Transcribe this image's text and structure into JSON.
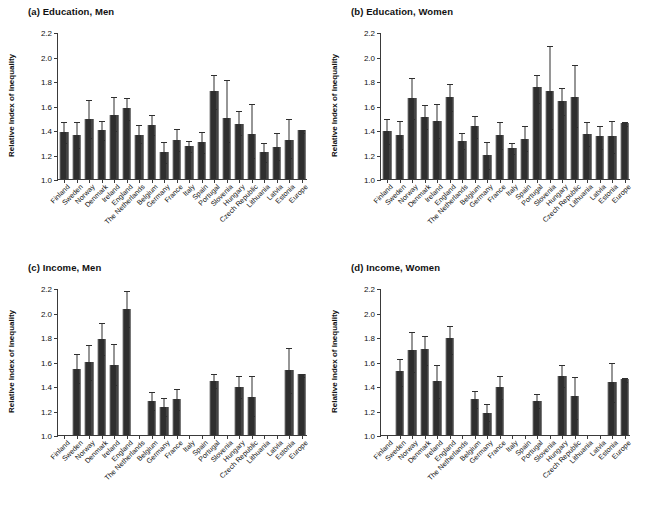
{
  "figure": {
    "ylabel": "Relative Index of Inequality",
    "ytick_labels": [
      "1.0",
      "1.2",
      "1.4",
      "1.6",
      "1.8",
      "2.0",
      "2.2"
    ],
    "bar_color": "#2f2f2f",
    "axis_color": "#3a3a3a"
  },
  "chart_data": [
    {
      "type": "bar",
      "panel": "a",
      "title": "(a) Education, Men",
      "xlabel": "",
      "ylabel": "Relative Index of Inequality",
      "ylim": [
        1.0,
        2.2
      ],
      "yticks": [
        1.0,
        1.2,
        1.4,
        1.6,
        1.8,
        2.0,
        2.2
      ],
      "grid": false,
      "legend": "none",
      "error_bars": "95% CI",
      "categories": [
        "Finland",
        "Sweden",
        "Norway",
        "Denmark",
        "Ireland",
        "England",
        "The Netherlands",
        "Belgium",
        "Germany",
        "France",
        "Italy",
        "Spain",
        "Portugal",
        "Slovenia",
        "Hungary",
        "Czech Republic",
        "Lithuania",
        "Latvia",
        "Estonia",
        "Europe"
      ],
      "values": [
        1.38,
        1.36,
        1.49,
        1.4,
        1.52,
        1.58,
        1.36,
        1.44,
        1.22,
        1.32,
        1.27,
        1.3,
        1.72,
        1.5,
        1.45,
        1.37,
        1.22,
        1.26,
        1.32,
        1.4
      ],
      "ci_low": [
        1.3,
        1.26,
        1.34,
        1.33,
        1.4,
        1.49,
        1.3,
        1.37,
        1.14,
        1.24,
        1.23,
        1.22,
        1.58,
        1.31,
        1.37,
        1.18,
        1.15,
        1.16,
        1.18,
        1.38
      ],
      "ci_high": [
        1.47,
        1.47,
        1.65,
        1.48,
        1.68,
        1.67,
        1.45,
        1.53,
        1.31,
        1.42,
        1.32,
        1.39,
        1.86,
        1.82,
        1.56,
        1.62,
        1.3,
        1.38,
        1.5,
        1.41
      ]
    },
    {
      "type": "bar",
      "panel": "b",
      "title": "(b) Education, Women",
      "xlabel": "",
      "ylabel": "Relative Index of Inequality",
      "ylim": [
        1.0,
        2.2
      ],
      "yticks": [
        1.0,
        1.2,
        1.4,
        1.6,
        1.8,
        2.0,
        2.2
      ],
      "grid": false,
      "legend": "none",
      "error_bars": "95% CI",
      "categories": [
        "Finland",
        "Sweden",
        "Norway",
        "Denmark",
        "Ireland",
        "England",
        "The Netherlands",
        "Belgium",
        "Germany",
        "France",
        "Italy",
        "Spain",
        "Portugal",
        "Slovenia",
        "Hungary",
        "Czech Republic",
        "Lithuania",
        "Latvia",
        "Estonia",
        "Europe"
      ],
      "values": [
        1.39,
        1.36,
        1.66,
        1.51,
        1.47,
        1.67,
        1.31,
        1.43,
        1.2,
        1.36,
        1.25,
        1.33,
        1.75,
        1.72,
        1.64,
        1.67,
        1.37,
        1.35,
        1.35,
        1.46
      ],
      "ci_low": [
        1.29,
        1.25,
        1.5,
        1.42,
        1.34,
        1.56,
        1.25,
        1.34,
        1.09,
        1.25,
        1.21,
        1.24,
        1.63,
        1.42,
        1.53,
        1.43,
        1.28,
        1.25,
        1.22,
        1.44
      ],
      "ci_high": [
        1.5,
        1.48,
        1.83,
        1.61,
        1.62,
        1.78,
        1.38,
        1.52,
        1.31,
        1.47,
        1.3,
        1.44,
        1.86,
        2.09,
        1.75,
        1.94,
        1.47,
        1.44,
        1.48,
        1.47
      ]
    },
    {
      "type": "bar",
      "panel": "c",
      "title": "(c) Income, Men",
      "xlabel": "",
      "ylabel": "Relative Index of Inequality",
      "ylim": [
        1.0,
        2.2
      ],
      "yticks": [
        1.0,
        1.2,
        1.4,
        1.6,
        1.8,
        2.0,
        2.2
      ],
      "grid": false,
      "legend": "none",
      "error_bars": "95% CI",
      "categories": [
        "Finland",
        "Sweden",
        "Norway",
        "Denmark",
        "Ireland",
        "England",
        "The Netherlands",
        "Belgium",
        "Germany",
        "France",
        "Italy",
        "Spain",
        "Portugal",
        "Slovenia",
        "Hungary",
        "Czech Republic",
        "Lithuania",
        "Latvia",
        "Estonia",
        "Europe"
      ],
      "values": [
        null,
        1.54,
        1.6,
        1.78,
        1.57,
        2.03,
        null,
        1.28,
        1.23,
        1.29,
        null,
        null,
        1.44,
        null,
        1.39,
        1.31,
        null,
        null,
        1.53,
        1.5
      ],
      "ci_low": [
        null,
        1.43,
        1.46,
        1.66,
        1.42,
        1.89,
        null,
        1.21,
        1.16,
        1.21,
        null,
        null,
        1.39,
        null,
        1.31,
        1.16,
        null,
        null,
        1.35,
        1.48
      ],
      "ci_high": [
        null,
        1.67,
        1.74,
        1.92,
        1.75,
        2.18,
        null,
        1.36,
        1.31,
        1.38,
        null,
        null,
        1.51,
        null,
        1.49,
        1.49,
        null,
        null,
        1.72,
        1.51
      ]
    },
    {
      "type": "bar",
      "panel": "d",
      "title": "(d) Income, Women",
      "xlabel": "",
      "ylabel": "Relative Index of Inequality",
      "ylim": [
        1.0,
        2.2
      ],
      "yticks": [
        1.0,
        1.2,
        1.4,
        1.6,
        1.8,
        2.0,
        2.2
      ],
      "grid": false,
      "legend": "none",
      "error_bars": "95% CI",
      "categories": [
        "Finland",
        "Sweden",
        "Norway",
        "Denmark",
        "Ireland",
        "England",
        "The Netherlands",
        "Belgium",
        "Germany",
        "France",
        "Italy",
        "Spain",
        "Portugal",
        "Slovenia",
        "Hungary",
        "Czech Republic",
        "Lithuania",
        "Latvia",
        "Estonia",
        "Europe"
      ],
      "values": [
        null,
        1.52,
        1.69,
        1.7,
        1.44,
        1.79,
        null,
        1.29,
        1.18,
        1.39,
        null,
        null,
        1.28,
        null,
        1.48,
        1.32,
        null,
        null,
        1.43,
        1.46
      ],
      "ci_low": [
        null,
        1.41,
        1.52,
        1.58,
        1.31,
        1.67,
        null,
        1.23,
        1.12,
        1.3,
        null,
        null,
        1.23,
        null,
        1.4,
        1.14,
        null,
        null,
        1.28,
        1.44
      ],
      "ci_high": [
        null,
        1.63,
        1.85,
        1.82,
        1.58,
        1.9,
        null,
        1.37,
        1.26,
        1.49,
        null,
        null,
        1.34,
        null,
        1.58,
        1.48,
        null,
        null,
        1.6,
        1.47
      ]
    }
  ]
}
